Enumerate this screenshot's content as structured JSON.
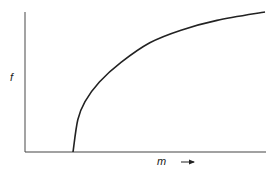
{
  "chart_data": {
    "type": "line",
    "title": "",
    "xlabel": "m",
    "ylabel": "f",
    "xlabel_arrow": "→",
    "grid": false,
    "legend": null,
    "x_ticks": [],
    "y_ticks": [],
    "series": [
      {
        "name": "f(m)",
        "description": "Saturating curve: zero until threshold m0, then rises steeply and levels off",
        "points_normalized": [
          {
            "x": 0.2,
            "y": 0.0
          },
          {
            "x": 0.22,
            "y": 0.23
          },
          {
            "x": 0.25,
            "y": 0.36
          },
          {
            "x": 0.31,
            "y": 0.5
          },
          {
            "x": 0.4,
            "y": 0.64
          },
          {
            "x": 0.52,
            "y": 0.78
          },
          {
            "x": 0.65,
            "y": 0.87
          },
          {
            "x": 0.8,
            "y": 0.94
          },
          {
            "x": 1.0,
            "y": 1.0
          }
        ]
      }
    ],
    "axis_range_normalized": {
      "x": [
        0,
        1
      ],
      "y": [
        0,
        1
      ]
    }
  },
  "labels": {
    "y_axis": "f",
    "x_axis": "m"
  },
  "colors": {
    "axis": "#555555",
    "curve": "#222222",
    "background": "#ffffff"
  }
}
